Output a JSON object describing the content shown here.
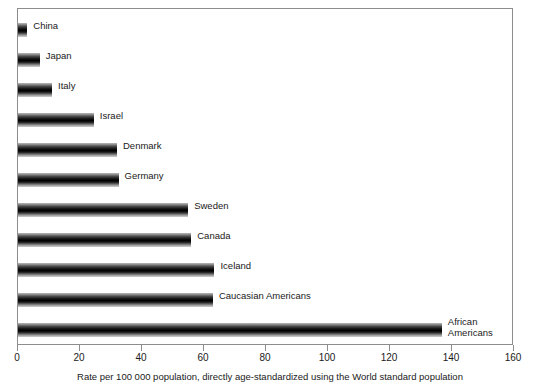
{
  "chart_data": {
    "type": "bar",
    "orientation": "horizontal",
    "title": "",
    "xlabel": "Rate per 100 000 population, directly age-standardized using the World standard population",
    "ylabel": "",
    "xlim": [
      0,
      160
    ],
    "xticks": [
      0,
      20,
      40,
      60,
      80,
      100,
      120,
      140,
      160
    ],
    "grid": false,
    "legend": "none",
    "categories": [
      "China",
      "Japan",
      "Italy",
      "Israel",
      "Denmark",
      "Germany",
      "Sweden",
      "Canada",
      "Iceland",
      "Caucasian Americans",
      "African Americans"
    ],
    "values": [
      3,
      7,
      11,
      24.5,
      32,
      32.5,
      55,
      56,
      63.5,
      63,
      137
    ],
    "bars": [
      {
        "label": "China",
        "value": 3,
        "label_lines": [
          "China"
        ]
      },
      {
        "label": "Japan",
        "value": 7,
        "label_lines": [
          "Japan"
        ]
      },
      {
        "label": "Italy",
        "value": 11,
        "label_lines": [
          "Italy"
        ]
      },
      {
        "label": "Israel",
        "value": 24.5,
        "label_lines": [
          "Israel"
        ]
      },
      {
        "label": "Denmark",
        "value": 32,
        "label_lines": [
          "Denmark"
        ]
      },
      {
        "label": "Germany",
        "value": 32.5,
        "label_lines": [
          "Germany"
        ]
      },
      {
        "label": "Sweden",
        "value": 55,
        "label_lines": [
          "Sweden"
        ]
      },
      {
        "label": "Canada",
        "value": 56,
        "label_lines": [
          "Canada"
        ]
      },
      {
        "label": "Iceland",
        "value": 63.5,
        "label_lines": [
          "Iceland"
        ]
      },
      {
        "label": "Caucasian Americans",
        "value": 63,
        "label_lines": [
          "Caucasian Americans"
        ]
      },
      {
        "label": "African Americans",
        "value": 137,
        "label_lines": [
          "African",
          "Americans"
        ]
      }
    ],
    "colors": {
      "bar_dark": "#000000",
      "bar_light": "#cfcfcf",
      "axis": "#8d8d8d",
      "text": "#1a1a1a",
      "background": "#ffffff"
    }
  },
  "axis": {
    "tick_labels": [
      "0",
      "20",
      "40",
      "60",
      "80",
      "100",
      "120",
      "140",
      "160"
    ]
  },
  "caption": {
    "text": "Rate per 100 000 population, directly age-standardized using the World standard population"
  },
  "bar_labels": {
    "china": "China",
    "japan": "Japan",
    "italy": "Italy",
    "israel": "Israel",
    "denmark": "Denmark",
    "germany": "Germany",
    "sweden": "Sweden",
    "canada": "Canada",
    "iceland": "Iceland",
    "caucasian_americans": "Caucasian Americans",
    "african_americans_line1": "African",
    "african_americans_line2": "Americans"
  }
}
